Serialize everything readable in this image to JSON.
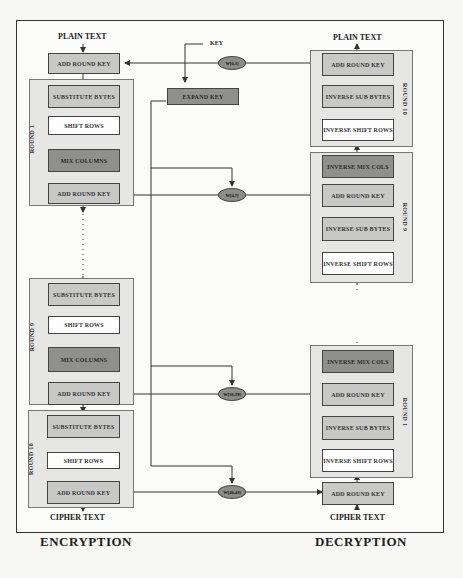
{
  "diagram": {
    "encryption": {
      "title": "ENCRYPTION",
      "input_label": "PLAIN TEXT",
      "output_label": "CIPHER TEXT",
      "initial_step": "ADD ROUND KEY",
      "rounds": [
        {
          "label": "ROUND 1",
          "steps": [
            "SUBSTITUTE BYTES",
            "SHIFT ROWS",
            "MIX COLUMNS",
            "ADD ROUND KEY"
          ]
        },
        {
          "label": "ROUND 9",
          "steps": [
            "SUBSTITUTE BYTES",
            "SHIFT ROWS",
            "MIX COLUMNS",
            "ADD ROUND KEY"
          ]
        },
        {
          "label": "ROUND 10",
          "steps": [
            "SUBSTITUTE BYTES",
            "SHIFT ROWS",
            "ADD ROUND KEY"
          ]
        }
      ]
    },
    "decryption": {
      "title": "DECRYPTION",
      "input_label": "CIPHER TEXT",
      "output_label": "PLAIN TEXT",
      "initial_step": "ADD ROUND KEY",
      "rounds": [
        {
          "label": "ROUND 10",
          "steps": [
            "ADD ROUND KEY",
            "INVERSE SUB BYTES",
            "INVERSE SHIFT ROWS"
          ]
        },
        {
          "label": "ROUND 9",
          "steps": [
            "INVERSE MIX COLS",
            "ADD ROUND KEY",
            "INVERSE SUB BYTES",
            "INVERSE SHIFT ROWS"
          ]
        },
        {
          "label": "ROUND 1",
          "steps": [
            "INVERSE MIX COLS",
            "ADD ROUND KEY",
            "INVERSE SUB BYTES",
            "INVERSE SHIFT ROWS"
          ]
        }
      ]
    },
    "key_schedule": {
      "key_label": "KEY",
      "expand_label": "EXPAND KEY",
      "words": [
        "W[0,3]",
        "W[4,7]",
        "W[36,39]",
        "W[40,43]"
      ]
    },
    "colors": {
      "round_bg": "#e6e6e4",
      "box_mid": "#c8c8c6",
      "box_dark": "#8f8f8d",
      "box_light": "#fdfdfd",
      "key_oval": "#8c8c8a",
      "line": "#333333"
    }
  }
}
